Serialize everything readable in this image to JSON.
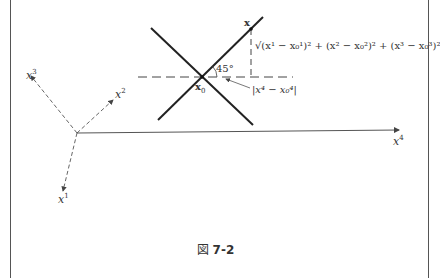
{
  "figure": {
    "caption_prefix": "図",
    "caption_number": "7-2",
    "axes": {
      "x1": {
        "base": "x",
        "sup": "1"
      },
      "x2": {
        "base": "x",
        "sup": "2"
      },
      "x3": {
        "base": "x",
        "sup": "3"
      },
      "x4": {
        "base": "x",
        "sup": "4"
      }
    },
    "point_x": "x",
    "point_x0": "x",
    "point_x0_sub": "0",
    "angle_label": "45°",
    "vertical_distance": "√(x¹ − x₀¹)² + (x² − x₀²)² + (x³ − x₀³)²",
    "horizontal_distance": "|x⁴ − x₀⁴|"
  }
}
